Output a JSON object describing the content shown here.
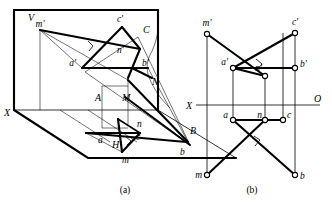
{
  "figure": {
    "title": "",
    "type": "descriptive-geometry-projection",
    "subfigures": [
      {
        "id": "a",
        "caption": "(a)",
        "description": "Pictorial view of V and H projection planes"
      },
      {
        "id": "b",
        "caption": "(b)",
        "description": "Orthographic two-view projection drawing"
      }
    ]
  },
  "pictorial": {
    "plane_labels": {
      "vertical_plane": "V",
      "horizontal_plane": "H",
      "x_axis": "X"
    },
    "space_points": [
      {
        "name": "A",
        "label": "A"
      },
      {
        "name": "B",
        "label": "B"
      },
      {
        "name": "C",
        "label": "C"
      },
      {
        "name": "M",
        "label": "M"
      },
      {
        "name": "N",
        "label": "N"
      }
    ],
    "front_projections": [
      {
        "name": "a-prime",
        "label": "a'"
      },
      {
        "name": "b-prime",
        "label": "b'"
      },
      {
        "name": "c-prime",
        "label": "c'"
      },
      {
        "name": "m-prime",
        "label": "m'"
      },
      {
        "name": "n-prime",
        "label": "n'"
      }
    ],
    "top_projections": [
      {
        "name": "a-top",
        "label": "a"
      },
      {
        "name": "b-top",
        "label": "b"
      },
      {
        "name": "c-top",
        "label": "c"
      },
      {
        "name": "m-top",
        "label": "m"
      },
      {
        "name": "n-top",
        "label": "n"
      }
    ]
  },
  "orthographic": {
    "axis_labels": {
      "left": "X",
      "right": "O"
    },
    "front_view_points": [
      {
        "name": "m-prime",
        "label": "m'"
      },
      {
        "name": "c-prime",
        "label": "c'"
      },
      {
        "name": "a-prime",
        "label": "a'"
      },
      {
        "name": "n-prime",
        "label": "n'"
      },
      {
        "name": "b-prime",
        "label": "b'"
      }
    ],
    "top_view_points": [
      {
        "name": "a-top",
        "label": "a"
      },
      {
        "name": "n-top",
        "label": "n"
      },
      {
        "name": "c-top",
        "label": "c"
      },
      {
        "name": "m-top",
        "label": "m"
      },
      {
        "name": "b-top",
        "label": "b"
      }
    ]
  },
  "captions": {
    "left": "(a)",
    "right": "(b)"
  },
  "colors": {
    "ink": "#000000",
    "paper": "#ffffff"
  }
}
